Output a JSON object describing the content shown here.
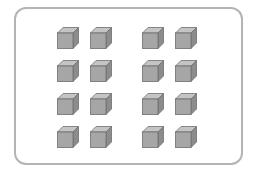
{
  "figure": {
    "frame_color": "#b4b4b4",
    "cube_colors": {
      "front": "#a6a6a6",
      "top": "#c4c4c4",
      "side": "#8c8c8c",
      "edge": "#6e6e6e"
    },
    "rows": 4,
    "groups_per_row": 2,
    "cubes_per_group": 2,
    "total_cubes": 16,
    "cube_positions": [
      {
        "x": 57,
        "y": 27
      },
      {
        "x": 90,
        "y": 27
      },
      {
        "x": 142,
        "y": 27
      },
      {
        "x": 175,
        "y": 27
      },
      {
        "x": 57,
        "y": 60
      },
      {
        "x": 90,
        "y": 60
      },
      {
        "x": 142,
        "y": 60
      },
      {
        "x": 175,
        "y": 60
      },
      {
        "x": 57,
        "y": 93
      },
      {
        "x": 90,
        "y": 93
      },
      {
        "x": 142,
        "y": 93
      },
      {
        "x": 175,
        "y": 93
      },
      {
        "x": 57,
        "y": 126
      },
      {
        "x": 90,
        "y": 126
      },
      {
        "x": 142,
        "y": 126
      },
      {
        "x": 175,
        "y": 126
      }
    ]
  }
}
